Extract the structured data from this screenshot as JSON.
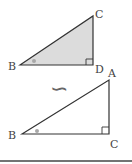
{
  "diagram": {
    "type": "similar-triangles",
    "relation_symbol": "∽",
    "top_triangle": {
      "labels": {
        "B": "B",
        "C": "C",
        "D": "D"
      },
      "fill": "#dcdcdc",
      "right_angle_at": "D",
      "marked_angle_at": "B"
    },
    "bottom_triangle": {
      "labels": {
        "B": "B",
        "A": "A",
        "C": "C"
      },
      "fill": "#ffffff",
      "right_angle_at": "C",
      "marked_angle_at": "B"
    },
    "colors": {
      "stroke": "#333333",
      "shade": "#dcdcdc",
      "angle_dot": "#a8a8a8",
      "label": "#444444"
    }
  }
}
